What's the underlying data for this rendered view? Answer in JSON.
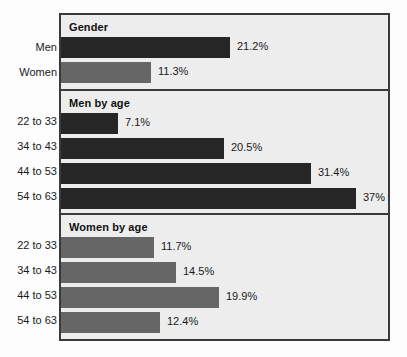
{
  "chart_data": {
    "type": "bar",
    "orientation": "horizontal",
    "title": "",
    "xlabel": "",
    "ylabel": "",
    "grid": false,
    "legend": "none",
    "value_suffix": "%",
    "xlim": [
      0,
      37
    ],
    "series_colors": {
      "men": "#262626",
      "women": "#666666"
    },
    "frame_background": "#ededed",
    "frame_border": "#3a3a3a",
    "page_background": "#fdfdfd",
    "sections": [
      {
        "title": "Gender",
        "group": "mixed",
        "categories": [
          "Men",
          "Women"
        ],
        "values": [
          21.2,
          11.3
        ],
        "labels": [
          "21.2%",
          "11.3%"
        ],
        "colors": [
          "men",
          "women"
        ]
      },
      {
        "title": "Men by age",
        "group": "men",
        "categories": [
          "22 to 33",
          "34 to 43",
          "44 to 53",
          "54 to 63"
        ],
        "values": [
          7.1,
          20.5,
          31.4,
          37
        ],
        "labels": [
          "7.1%",
          "20.5%",
          "31.4%",
          "37%"
        ],
        "colors": [
          "men",
          "men",
          "men",
          "men"
        ]
      },
      {
        "title": "Women by age",
        "group": "women",
        "categories": [
          "22 to 33",
          "34 to 43",
          "44 to 53",
          "54 to 63"
        ],
        "values": [
          11.7,
          14.5,
          19.9,
          12.4
        ],
        "labels": [
          "11.7%",
          "14.5%",
          "19.9%",
          "12.4%"
        ],
        "colors": [
          "women",
          "women",
          "women",
          "women"
        ]
      }
    ]
  }
}
